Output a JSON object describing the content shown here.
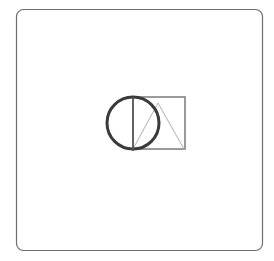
{
  "canvas": {
    "width": 274,
    "height": 261,
    "background": "#ffffff"
  },
  "frame": {
    "x": 16.5,
    "y": 9.5,
    "width": 246,
    "height": 241,
    "rx": 7,
    "stroke": "#6e6e6e",
    "stroke_width": 1.2
  },
  "shapes": {
    "square": {
      "x": 133,
      "y": 97,
      "width": 52,
      "height": 52,
      "stroke": "#7a7a7a",
      "stroke_width": 1.5
    },
    "circle": {
      "cx": 133,
      "cy": 123,
      "r": 26,
      "stroke": "#3a3a3a",
      "stroke_width": 3
    },
    "diameter_line": {
      "x1": 133,
      "y1": 97,
      "x2": 133,
      "y2": 151,
      "stroke": "#555555",
      "stroke_width": 1.6
    },
    "triangle": {
      "points": "133,149 158,103 184,149",
      "stroke": "#b0b0b0",
      "stroke_width": 1
    }
  }
}
